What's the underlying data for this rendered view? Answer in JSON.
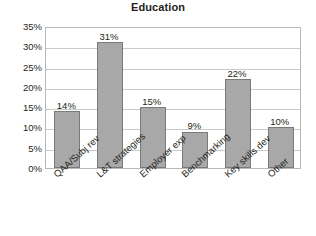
{
  "chart_data": {
    "type": "bar",
    "title": "Education",
    "xlabel": "",
    "ylabel": "",
    "ylim": [
      0,
      35
    ],
    "grid": true,
    "legend": false,
    "categories": [
      "QAA/Subj rev",
      "L&T strategies",
      "Employer exp",
      "Benchmarking",
      "Key skills dev",
      "Other"
    ],
    "values": [
      14,
      31,
      15,
      9,
      22,
      10
    ],
    "value_labels": [
      "14%",
      "31%",
      "15%",
      "9%",
      "22%",
      "10%"
    ],
    "ytick_labels": [
      "35%",
      "30%",
      "25%",
      "20%",
      "15%",
      "10%",
      "5%",
      "0%"
    ],
    "ytick_values": [
      35,
      30,
      25,
      20,
      15,
      10,
      5,
      0
    ],
    "colors": {
      "bar_fill": "#a8a8a8",
      "bar_border": "#7a7a7a",
      "gridline": "#c9c9c9",
      "frame": "#b8b8b8",
      "text": "#231f20",
      "background": "#ffffff"
    }
  }
}
